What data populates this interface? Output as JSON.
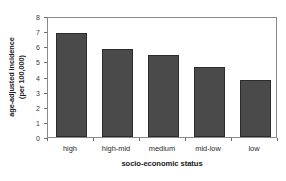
{
  "chart_data": {
    "type": "bar",
    "title": "",
    "subtitle": "",
    "categories": [
      "high",
      "high-mid",
      "medium",
      "mid-low",
      "low"
    ],
    "values": [
      6.9,
      5.85,
      5.4,
      4.65,
      3.8
    ],
    "xlabel": "socio-economic status",
    "ylabel_line1": "age-adjusted incidence",
    "ylabel_line2": "(per 100,000)",
    "ylabel": "age-adjusted incidence (per 100,000)",
    "ylim": [
      0,
      8
    ],
    "yticks": [
      0,
      1,
      2,
      3,
      4,
      5,
      6,
      7,
      8
    ],
    "ytick_labels": [
      "0",
      "1",
      "2",
      "3",
      "4",
      "5",
      "6",
      "7",
      "8"
    ],
    "grid": false,
    "legend": false,
    "legend_position": "none",
    "bar_color": "#4a4a4a",
    "bar_edge_color": "#2b2b2b",
    "frame_color": "#8a8a8a",
    "background_color": "#ffffff"
  }
}
